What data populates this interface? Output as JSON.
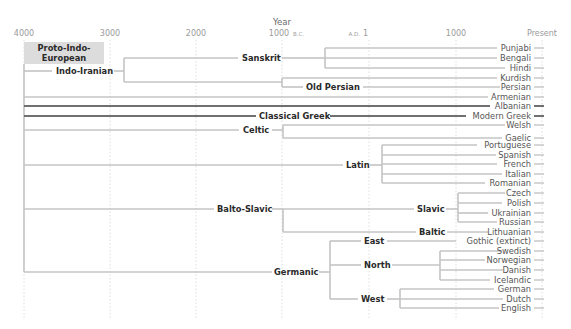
{
  "axis": {
    "title": "Year",
    "ticks": [
      {
        "label": "4000",
        "suffix": "",
        "x": 24
      },
      {
        "label": "3000",
        "suffix": "",
        "x": 110
      },
      {
        "label": "2000",
        "suffix": "",
        "x": 196
      },
      {
        "label": "1000",
        "suffix": "B.C.",
        "x": 282
      },
      {
        "label": "1",
        "prefix": "A.D.",
        "x": 369
      },
      {
        "label": "1000",
        "suffix": "",
        "x": 456
      },
      {
        "label": "Present",
        "suffix": "",
        "x": 542
      }
    ]
  },
  "root": {
    "label_line1": "Proto-Indo-",
    "label_line2": "European",
    "bg": "#dcdcdc"
  },
  "branches": {
    "indo_iranian": "Indo-Iranian",
    "sanskrit": "Sanskrit",
    "old_persian": "Old Persian",
    "classical_greek": "Classical Greek",
    "celtic": "Celtic",
    "latin": "Latin",
    "balto_slavic": "Balto-Slavic",
    "slavic": "Slavic",
    "baltic": "Baltic",
    "germanic": "Germanic",
    "east": "East",
    "north": "North",
    "west": "West"
  },
  "languages": [
    "Punjabi",
    "Bengali",
    "Hindi",
    "Kurdish",
    "Persian",
    "Armenian",
    "Albanian",
    "Modern Greek",
    "Welsh",
    "Gaelic",
    "Portuguese",
    "Spanish",
    "French",
    "Italian",
    "Romanian",
    "Czech",
    "Polish",
    "Ukrainian",
    "Russian",
    "Lithuanian",
    "Gothic (extinct)",
    "Swedish",
    "Norwegian",
    "Danish",
    "Icelandic",
    "German",
    "Dutch",
    "English"
  ],
  "colors": {
    "line_light": "#c4c4c4",
    "line_dark": "#707070",
    "grid": "#d0d0d0"
  }
}
